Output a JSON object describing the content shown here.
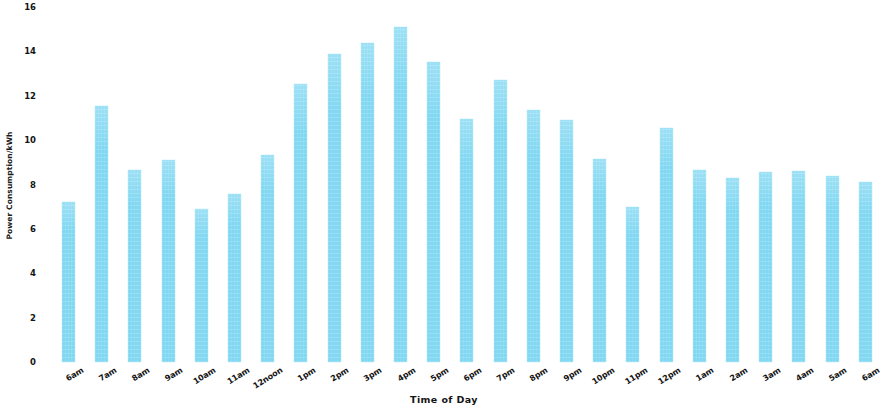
{
  "chart_data": {
    "type": "bar",
    "title": "",
    "xlabel": "Time of Day",
    "ylabel": "Power Consumption/kWh",
    "categories": [
      "6am",
      "7am",
      "8am",
      "9am",
      "10am",
      "11am",
      "12noon",
      "1pm",
      "2pm",
      "3pm",
      "4pm",
      "5pm",
      "6pm",
      "7pm",
      "8pm",
      "9pm",
      "10pm",
      "11pm",
      "12pm",
      "1am",
      "2am",
      "3am",
      "4am",
      "5am",
      "6am"
    ],
    "values": [
      7.2,
      11.55,
      8.65,
      9.1,
      6.9,
      7.55,
      9.35,
      12.55,
      13.9,
      14.4,
      15.1,
      13.5,
      10.95,
      12.7,
      11.35,
      10.9,
      9.15,
      7.0,
      10.55,
      8.65,
      8.3,
      8.55,
      8.6,
      8.4,
      8.1
    ],
    "ylim": [
      0,
      16
    ],
    "yticks": [
      0,
      2,
      4,
      6,
      8,
      10,
      12,
      14,
      16
    ],
    "ytick_labels": [
      "0",
      "2",
      "4",
      "6",
      "8",
      "10",
      "12",
      "14",
      "16"
    ],
    "grid": false,
    "legend": null,
    "bar_color": "#7fd7f2",
    "background_color": "#ffffff"
  }
}
